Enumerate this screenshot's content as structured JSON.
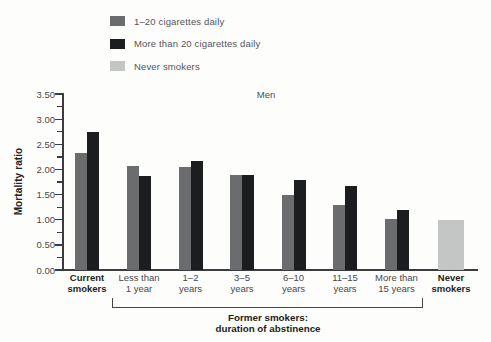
{
  "chart_data": {
    "type": "bar",
    "title": "Men",
    "xlabel": "",
    "ylabel": "Mortality ratio",
    "ylim": [
      0,
      3.5
    ],
    "ytick_labels": [
      "0.00",
      "0.50",
      "1.00",
      "1.50",
      "2.00",
      "2.50",
      "3.00",
      "3.50"
    ],
    "ytick_minor_step": 0.25,
    "grid": false,
    "legend_position": "top-left",
    "categories": [
      {
        "line1": "Current",
        "line2": "smokers",
        "bold": true
      },
      {
        "line1": "Less than",
        "line2": "1 year",
        "bold": false
      },
      {
        "line1": "1–2",
        "line2": "years",
        "bold": false
      },
      {
        "line1": "3–5",
        "line2": "years",
        "bold": false
      },
      {
        "line1": "6–10",
        "line2": "years",
        "bold": false
      },
      {
        "line1": "11–15",
        "line2": "years",
        "bold": false
      },
      {
        "line1": "More than",
        "line2": "15 years",
        "bold": false
      },
      {
        "line1": "Never",
        "line2": "smokers",
        "bold": true
      }
    ],
    "series": [
      {
        "name": "1–20 cigarettes daily",
        "color": "#6b6c6e",
        "values": [
          2.33,
          2.07,
          2.05,
          1.88,
          1.49,
          1.3,
          1.02,
          null
        ]
      },
      {
        "name": "More than 20 cigarettes daily",
        "color": "#1c1d1f",
        "values": [
          2.75,
          1.86,
          2.16,
          1.88,
          1.78,
          1.67,
          1.19,
          null
        ]
      },
      {
        "name": "Never smokers",
        "color": "#c4c6c5",
        "values": [
          null,
          null,
          null,
          null,
          null,
          null,
          null,
          1.0
        ]
      }
    ],
    "group_label": {
      "line1": "Former smokers:",
      "line2": "duration of abstinence",
      "spans_categories": [
        "Less than 1 year",
        "More than 15 years"
      ]
    }
  }
}
